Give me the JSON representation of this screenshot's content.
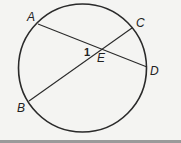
{
  "diagram": {
    "circle": {
      "cx": 82.5,
      "cy": 68,
      "r": 64
    },
    "points": {
      "A": {
        "label": "A",
        "x": 38,
        "y": 24
      },
      "B": {
        "label": "B",
        "x": 29,
        "y": 101
      },
      "C": {
        "label": "C",
        "x": 132,
        "y": 28
      },
      "D": {
        "label": "D",
        "x": 147,
        "y": 67
      },
      "E": {
        "label": "E",
        "x": 102,
        "y": 50
      }
    },
    "chords": [
      "AD",
      "BC"
    ],
    "angle_label": "1",
    "colors": {
      "stroke": "#2a2a2a",
      "background": "#f4f4f2",
      "bottom_bar": "#9a9a9a"
    }
  }
}
